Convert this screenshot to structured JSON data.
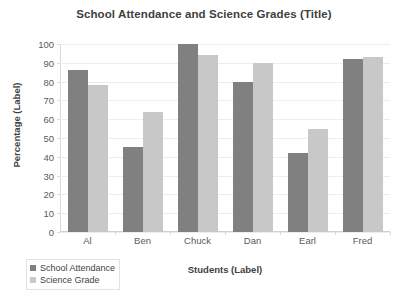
{
  "chart_data": {
    "type": "bar",
    "title": "School Attendance and Science Grades (Title)",
    "xlabel": "Students (Label)",
    "ylabel": "Percentage (Label)",
    "categories": [
      "Al",
      "Ben",
      "Chuck",
      "Dan",
      "Earl",
      "Fred"
    ],
    "series": [
      {
        "name": "School Attendance",
        "color": "#808080",
        "values": [
          86,
          45,
          100,
          80,
          42,
          92
        ]
      },
      {
        "name": "Science Grade",
        "color": "#c8c8c8",
        "values": [
          78,
          64,
          94,
          90,
          55,
          93
        ]
      }
    ],
    "ylim": [
      0,
      100
    ],
    "yticks": [
      0,
      10,
      20,
      30,
      40,
      50,
      60,
      70,
      80,
      90,
      100
    ],
    "grid": true,
    "legend_position": "bottom-left"
  },
  "legend": {
    "items": [
      {
        "label": "School Attendance"
      },
      {
        "label": "Science Grade"
      }
    ]
  }
}
